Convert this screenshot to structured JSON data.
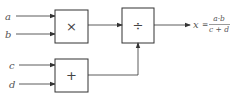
{
  "diagram": {
    "inputs": [
      {
        "name": "a",
        "label": "a"
      },
      {
        "name": "b",
        "label": "b"
      },
      {
        "name": "c",
        "label": "c"
      },
      {
        "name": "d",
        "label": "d"
      }
    ],
    "blocks": [
      {
        "name": "multiply",
        "symbol": "×"
      },
      {
        "name": "add",
        "symbol": "+"
      },
      {
        "name": "divide",
        "symbol": "÷"
      }
    ],
    "output": {
      "variable": "x",
      "equals": "=",
      "numerator": "a·b",
      "denominator": "c + d"
    },
    "colors": {
      "line": "#333333",
      "text": "#555555"
    }
  }
}
